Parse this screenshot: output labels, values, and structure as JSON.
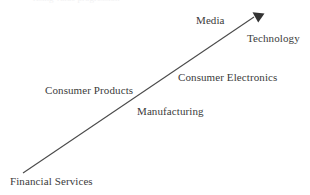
{
  "diagram": {
    "type": "arrow-progression",
    "title_clipped": "rising value progression",
    "background_color": "#ffffff",
    "arrow": {
      "name": "growth-arrow",
      "color": "#4a4a4a",
      "stroke_width": 1,
      "direction": "up-right",
      "tail": {
        "x": 23,
        "y": 173
      },
      "tip": {
        "x": 259,
        "y": 13
      },
      "arrowhead_style": "solid-triangle"
    },
    "labels": [
      {
        "id": "financial-services",
        "text": "Financial Services",
        "x": 10,
        "y": 175,
        "position": "below-tail"
      },
      {
        "id": "consumer-products",
        "text": "Consumer Products",
        "x": 45,
        "y": 84,
        "position": "above-left"
      },
      {
        "id": "manufacturing",
        "text": "Manufacturing",
        "x": 137,
        "y": 105,
        "position": "below-right"
      },
      {
        "id": "consumer-electronics",
        "text": "Consumer Electronics",
        "x": 178,
        "y": 71,
        "position": "above-right"
      },
      {
        "id": "media",
        "text": "Media",
        "x": 196,
        "y": 14,
        "position": "above-left"
      },
      {
        "id": "technology",
        "text": "Technology",
        "x": 247,
        "y": 32,
        "position": "below-tip"
      }
    ],
    "colors": {
      "text": "#3b3b3b",
      "line": "#4a4a4a",
      "background": "#ffffff"
    }
  }
}
